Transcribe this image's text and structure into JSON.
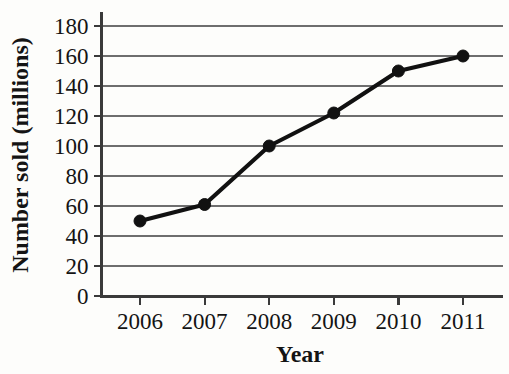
{
  "chart_data": {
    "type": "line",
    "title": "",
    "xlabel": "Year",
    "ylabel": "Number sold (millions)",
    "categories": [
      "2006",
      "2007",
      "2008",
      "2009",
      "2010",
      "2011"
    ],
    "values": [
      50,
      61,
      100,
      122,
      150,
      160
    ],
    "series": [
      {
        "name": "Number sold",
        "values": [
          50,
          61,
          100,
          122,
          150,
          160
        ]
      }
    ],
    "ylim": [
      0,
      180
    ],
    "ytick_step": 20,
    "yticks": [
      0,
      20,
      40,
      60,
      80,
      100,
      120,
      140,
      160,
      180
    ],
    "ytick_labels": [
      "0",
      "20",
      "40",
      "60",
      "80",
      "100",
      "120",
      "140",
      "160",
      "180"
    ],
    "xticks": [
      "2006",
      "2007",
      "2008",
      "2009",
      "2010",
      "2011"
    ],
    "grid": true,
    "grid_axis": "y",
    "legend": false,
    "legend_position": "none",
    "marker": "filled-circle",
    "line_color": "#111111",
    "marker_color": "#111111",
    "grid_color": "#6e6e6e",
    "axis_color": "#3a3a3a",
    "background_color": "#fdfdfb",
    "annotations": []
  }
}
